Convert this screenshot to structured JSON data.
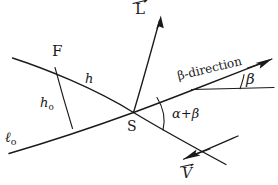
{
  "figure": {
    "type": "geometry-diagram",
    "style": "hand-drawn line figure",
    "background_color": "#ffffff",
    "ink_color": "#1a1a1a",
    "width": 278,
    "height": 185
  },
  "labels": {
    "point_f": "F",
    "point_s": "S",
    "vector_l": "L",
    "vector_v": "V",
    "segment_h": "h",
    "segment_h0_base": "h",
    "segment_h0_sub": "o",
    "line_l0_base": "ℓ",
    "line_l0_sub": "o",
    "angle_beta": "β",
    "angle_alpha_plus_beta": "α+β",
    "beta_direction": "β-direction"
  },
  "elements": {
    "line_h_name": "line-through-F-and-S",
    "line_l0_name": "baseline-l0",
    "segment_h0_name": "perpendicular-h0",
    "ray_l_name": "vector-L-ray",
    "ray_beta_name": "beta-direction-ray",
    "ray_v_name": "vector-V-ray",
    "horizontal_reference_name": "horizontal-reference-line",
    "arc_beta_name": "angle-arc-beta",
    "arc_alpha_beta_name": "angle-arc-alpha-plus-beta",
    "intersection_name": "intersection-point-S"
  }
}
